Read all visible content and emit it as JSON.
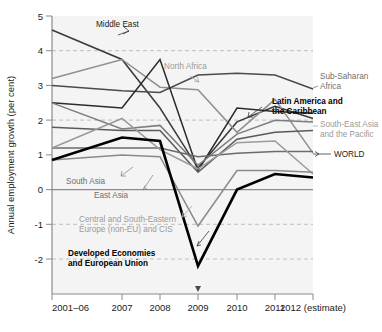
{
  "chart_data": {
    "type": "line",
    "title": "",
    "xlabel": "",
    "ylabel": "Annual employment growth (per cent)",
    "categories": [
      "2001–06",
      "2007",
      "2008",
      "2009",
      "2010",
      "2011",
      "2012 (estimate)"
    ],
    "ylim": [
      -2.6,
      5
    ],
    "yticks": [
      5,
      4,
      3,
      2,
      1,
      0,
      -1,
      -2
    ],
    "ytick_labels": [
      "5",
      "4",
      "3",
      "2",
      "1",
      "0",
      "-1",
      "-2"
    ],
    "grid": "dashed horizontal gridlines at 4, 2, -1, -2; solid zero line",
    "legend_position": "inline annotations at line ends",
    "series": [
      {
        "name": "Middle East",
        "color": "#3a3a3a",
        "width": 1.5,
        "values": [
          4.6,
          3.75,
          2.35,
          0.62,
          1.95,
          2.4,
          2.05
        ]
      },
      {
        "name": "North Africa",
        "color": "#8f8f8f",
        "width": 1.5,
        "values": [
          3.2,
          3.75,
          2.95,
          2.88,
          1.65,
          2.6,
          1.05
        ]
      },
      {
        "name": "Sub-Saharan Africa",
        "color": "#4a4a4a",
        "width": 1.5,
        "values": [
          3.0,
          2.85,
          2.8,
          3.3,
          3.35,
          3.3,
          2.9
        ]
      },
      {
        "name": "Latin America and the Caribbean",
        "color": "#2b2b2b",
        "width": 1.5,
        "values": [
          2.5,
          2.35,
          3.75,
          0.55,
          2.35,
          2.25,
          2.2
        ]
      },
      {
        "name": "South-East Asia and the Pacific",
        "color": "#7d7d7d",
        "width": 1.5,
        "values": [
          2.5,
          1.75,
          1.85,
          0.7,
          1.6,
          2.0,
          1.95
        ]
      },
      {
        "name": "WORLD",
        "color": "#5a5a5a",
        "width": 1.5,
        "values": [
          1.8,
          1.7,
          1.7,
          0.5,
          1.45,
          1.65,
          1.7
        ]
      },
      {
        "name": "South Asia",
        "color": "#6b6b6b",
        "width": 1.5,
        "values": [
          1.2,
          1.2,
          1.2,
          0.95,
          1.05,
          1.1,
          1.1
        ]
      },
      {
        "name": "East Asia",
        "color": "#9a9a9a",
        "width": 1.5,
        "values": [
          1.2,
          2.05,
          1.15,
          0.6,
          1.35,
          1.4,
          0.45
        ]
      },
      {
        "name": "Central and South-Eastern Europe (non-EU) and CIS",
        "color": "#8a8a8a",
        "width": 1.5,
        "values": [
          0.85,
          1.0,
          0.95,
          -1.05,
          0.55,
          0.55,
          0.5
        ]
      },
      {
        "name": "Developed Economies and European Union",
        "color": "#000000",
        "width": 2.6,
        "values": [
          0.85,
          1.5,
          1.4,
          -2.2,
          0.0,
          0.45,
          0.35
        ]
      }
    ],
    "annotations": [
      {
        "id": "ann-middle-east",
        "text": "Middle East",
        "style": "dark",
        "x": 96,
        "y": 24,
        "align": "start",
        "lines": [
          "Middle East"
        ]
      },
      {
        "id": "ann-north-africa",
        "text": "North Africa",
        "style": "light",
        "x": 164,
        "y": 66,
        "align": "start",
        "lines": [
          "North Africa"
        ]
      },
      {
        "id": "ann-sub-saharan",
        "text": "Sub-Saharan Africa",
        "style": "mid",
        "x": 320,
        "y": 75,
        "align": "start",
        "lines": [
          "Sub-Saharan",
          "Africa"
        ]
      },
      {
        "id": "ann-latin-america",
        "text": "Latin America and the Caribbean",
        "style": "bold",
        "x": 274,
        "y": 103,
        "align": "start",
        "lines": [
          "Latin America and",
          "the Caribbean"
        ]
      },
      {
        "id": "ann-south-east-asia",
        "text": "South-East Asia and the Pacific",
        "style": "light",
        "x": 320,
        "y": 124,
        "align": "start",
        "lines": [
          "South-East Asia",
          "and the Pacific"
        ]
      },
      {
        "id": "ann-world",
        "text": "WORLD",
        "style": "dark",
        "x": 334,
        "y": 158,
        "align": "start",
        "lines": [
          "WORLD"
        ]
      },
      {
        "id": "ann-south-asia",
        "text": "South Asia",
        "style": "mid",
        "x": 68,
        "y": 182,
        "align": "start",
        "lines": [
          "South Asia"
        ]
      },
      {
        "id": "ann-east-asia",
        "text": "East Asia",
        "style": "mid",
        "x": 96,
        "y": 196,
        "align": "start",
        "lines": [
          "East Asia"
        ]
      },
      {
        "id": "ann-central-europe",
        "text": "Central and South-Eastern Europe (non-EU) and CIS",
        "style": "light",
        "x": 81,
        "y": 222,
        "align": "start",
        "lines": [
          "Central and South-Eastern",
          "Europe (non-EU) and CIS"
        ]
      },
      {
        "id": "ann-developed",
        "text": "Developed Economies and European Union",
        "style": "bold",
        "x": 70,
        "y": 256,
        "align": "start",
        "lines": [
          "Developed Economies",
          "and European Union"
        ]
      }
    ]
  },
  "axis": {
    "y_title": "Annual employment growth (per cent)",
    "y_tick_5": "5",
    "y_tick_4": "4",
    "y_tick_3": "3",
    "y_tick_2": "2",
    "y_tick_1": "1",
    "y_tick_0": "0",
    "y_tick_m1": "-1",
    "y_tick_m2": "-2",
    "x_tick_0": "2001–06",
    "x_tick_1": "2007",
    "x_tick_2": "2008",
    "x_tick_3": "2009",
    "x_tick_4": "2010",
    "x_tick_5": "2011",
    "x_tick_6": "2012 (estimate)"
  },
  "annotation_text": {
    "middle_east": "Middle East",
    "north_africa": "North Africa",
    "sub_saharan_1": "Sub-Saharan",
    "sub_saharan_2": "Africa",
    "latin_america_1": "Latin America and",
    "latin_america_2": "the Caribbean",
    "sea_pacific_1": "South-East Asia",
    "sea_pacific_2": "and the Pacific",
    "world": "WORLD",
    "south_asia": "South Asia",
    "east_asia": "East Asia",
    "cseeu_1": "Central and South-Eastern",
    "cseeu_2": "Europe (non-EU) and CIS",
    "developed_1": "Developed Economies",
    "developed_2": "and European Union"
  },
  "colors": {
    "plot_background": "#f4f4f4",
    "grid_dashed": "#b9b9b9",
    "zero_line": "#8a8a8a",
    "axis": "#8a8a8a",
    "bold_series": "#000000",
    "text_dark": "#1a1a1a",
    "text_mid": "#6f6f6f",
    "text_light": "#9a9a9a"
  }
}
